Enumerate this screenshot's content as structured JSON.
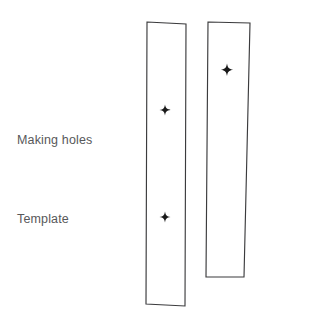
{
  "page": {
    "width": 324,
    "height": 319,
    "background_color": "#ffffff"
  },
  "labels": {
    "making_holes": "Making holes",
    "template": "Template",
    "text_color": "#58585a"
  },
  "diagram": {
    "stroke_color": "#3b3b3d",
    "fill_color": "#ffffff",
    "marker_color": "#1a1a1a",
    "shapes": [
      {
        "name": "template-strip-left",
        "kind": "quadrilateral",
        "points": "147,22 186,24 185,306 146,304",
        "hole_count": 2
      },
      {
        "name": "workpiece-strip-right",
        "kind": "quadrilateral",
        "points": "208,22 250,23 244,277 206,277",
        "hole_count": 1
      }
    ],
    "markers": [
      {
        "name": "hole-marker-left-upper",
        "x": 165,
        "y": 110,
        "size": 11
      },
      {
        "name": "hole-marker-left-lower",
        "x": 165,
        "y": 217,
        "size": 11
      },
      {
        "name": "hole-marker-right-upper",
        "x": 227,
        "y": 70,
        "size": 12
      }
    ]
  }
}
